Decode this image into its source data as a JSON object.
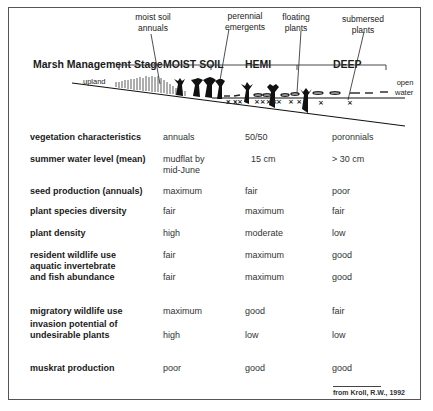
{
  "diagram": {
    "callouts": {
      "moist_soil_annuals": "moist soil\nannuals",
      "perennial_emergents": "perennial\nemergents",
      "floating_plants": "floating\nplants",
      "submersed_plants": "submersed\nplants"
    },
    "stage_title": "Marsh Management Stage",
    "stages": [
      "MOIST SOIL",
      "HEMI",
      "DEEP"
    ],
    "upland_label": "upland",
    "open_water_label": "open\nwater"
  },
  "table": {
    "rows": [
      {
        "label": "vegetation characteristics",
        "values": [
          "annuals",
          "50/50",
          "poronnials"
        ]
      },
      {
        "label": "summer water level (mean)",
        "values": [
          "mudflat by\nmid-June",
          "15 cm",
          "> 30 cm"
        ]
      },
      {
        "label": "seed production (annuals)",
        "values": [
          "maximum",
          "fair",
          "poor"
        ]
      },
      {
        "label": "plant species diversity",
        "values": [
          "fair",
          "maximum",
          "fair"
        ]
      },
      {
        "label": "plant density",
        "values": [
          "high",
          "moderate",
          "low"
        ]
      },
      {
        "label": "resident wildlife use",
        "values": [
          "fair",
          "maximum",
          "good"
        ]
      },
      {
        "label": "aquatic invertebrate\nand fish abundance",
        "values": [
          "fair",
          "maximum",
          "good"
        ]
      },
      {
        "label": "migratory wildlife use",
        "values": [
          "maximum",
          "good",
          "fair"
        ]
      },
      {
        "label": "invasion potential of\nundesirable plants",
        "values": [
          "high",
          "low",
          "low"
        ]
      },
      {
        "label": "muskrat production",
        "values": [
          "poor",
          "good",
          "good"
        ]
      }
    ]
  },
  "source": "from Kroll, R.W., 1992"
}
